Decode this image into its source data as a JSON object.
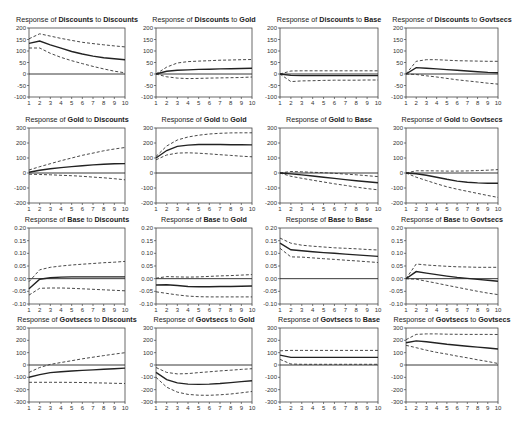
{
  "chart_data": {
    "type": "line",
    "layout": "4x4 grid of impulse response functions",
    "x": [
      1,
      2,
      3,
      4,
      5,
      6,
      7,
      8,
      9,
      10
    ],
    "variables": [
      "Discounts",
      "Gold",
      "Base",
      "Govtsecs"
    ],
    "panels": [
      {
        "row": 0,
        "col": 0,
        "title_prefix": "Response of ",
        "response": "Discounts",
        "title_mid": " to ",
        "shock": "Discounts",
        "ylim": [
          -100,
          200
        ],
        "yticks": [
          200,
          150,
          100,
          50,
          0,
          -50,
          -100
        ],
        "ytick_labels": [
          "200",
          "150",
          "100",
          "50",
          "0",
          "-50",
          "-100"
        ],
        "response_values": [
          133,
          143,
          127,
          112,
          98,
          87,
          78,
          71,
          66,
          62
        ],
        "upper": [
          153,
          175,
          165,
          155,
          146,
          138,
          132,
          127,
          122,
          118
        ],
        "lower": [
          113,
          113,
          90,
          72,
          58,
          45,
          33,
          22,
          12,
          5
        ]
      },
      {
        "row": 0,
        "col": 1,
        "title_prefix": "Response of ",
        "response": "Discounts",
        "title_mid": " to ",
        "shock": "Gold",
        "ylim": [
          -100,
          200
        ],
        "yticks": [
          200,
          150,
          100,
          50,
          0,
          -50,
          -100
        ],
        "ytick_labels": [
          "200",
          "150",
          "100",
          "50",
          "0",
          "-50",
          "-100"
        ],
        "response_values": [
          0,
          12,
          16,
          18,
          20,
          21,
          22,
          23,
          24,
          25
        ],
        "upper": [
          0,
          30,
          48,
          54,
          56,
          58,
          60,
          61,
          62,
          63
        ],
        "lower": [
          0,
          -12,
          -18,
          -20,
          -19,
          -18,
          -17,
          -16,
          -15,
          -13
        ]
      },
      {
        "row": 0,
        "col": 2,
        "title_prefix": "Response of ",
        "response": "Discounts",
        "title_mid": " to ",
        "shock": "Base",
        "ylim": [
          -100,
          200
        ],
        "yticks": [
          200,
          150,
          100,
          50,
          0,
          -50,
          -100
        ],
        "ytick_labels": [
          "200",
          "150",
          "100",
          "50",
          "0",
          "-50",
          "-100"
        ],
        "response_values": [
          0,
          -6,
          -7,
          -7,
          -7,
          -7,
          -7,
          -7,
          -7,
          -7
        ],
        "upper": [
          0,
          13,
          14,
          14,
          14,
          14,
          14,
          14,
          14,
          14
        ],
        "lower": [
          0,
          -33,
          -30,
          -29,
          -28,
          -27,
          -27,
          -27,
          -26,
          -26
        ]
      },
      {
        "row": 0,
        "col": 3,
        "title_prefix": "Response of ",
        "response": "Discounts",
        "title_mid": " to ",
        "shock": "Govtsecs",
        "ylim": [
          -100,
          200
        ],
        "yticks": [
          200,
          150,
          100,
          50,
          0,
          -50,
          -100
        ],
        "ytick_labels": [
          "200",
          "150",
          "100",
          "50",
          "0",
          "-50",
          "-100"
        ],
        "response_values": [
          0,
          28,
          25,
          22,
          19,
          16,
          13,
          10,
          7,
          5
        ],
        "upper": [
          0,
          55,
          62,
          62,
          60,
          58,
          57,
          56,
          55,
          55
        ],
        "lower": [
          0,
          -2,
          -8,
          -13,
          -19,
          -25,
          -30,
          -35,
          -40,
          -44
        ]
      },
      {
        "row": 1,
        "col": 0,
        "title_prefix": "Response of ",
        "response": "Gold",
        "title_mid": " to ",
        "shock": "Discounts",
        "ylim": [
          -200,
          300
        ],
        "yticks": [
          300,
          200,
          100,
          0,
          -100,
          -200
        ],
        "ytick_labels": [
          "300",
          "200",
          "100",
          "0",
          "-100",
          "-200"
        ],
        "response_values": [
          5,
          18,
          28,
          36,
          43,
          49,
          54,
          58,
          61,
          63
        ],
        "upper": [
          20,
          42,
          62,
          82,
          100,
          118,
          133,
          148,
          160,
          170
        ],
        "lower": [
          -8,
          -10,
          -12,
          -15,
          -18,
          -22,
          -27,
          -32,
          -38,
          -45
        ]
      },
      {
        "row": 1,
        "col": 1,
        "title_prefix": "Response of ",
        "response": "Gold",
        "title_mid": " to ",
        "shock": "Gold",
        "ylim": [
          -200,
          300
        ],
        "yticks": [
          300,
          200,
          100,
          0,
          -100,
          -200
        ],
        "ytick_labels": [
          "300",
          "200",
          "100",
          "0",
          "-100",
          "-200"
        ],
        "response_values": [
          100,
          150,
          177,
          186,
          190,
          190,
          190,
          189,
          188,
          187
        ],
        "upper": [
          110,
          180,
          220,
          240,
          252,
          260,
          265,
          267,
          268,
          268
        ],
        "lower": [
          88,
          120,
          133,
          135,
          132,
          127,
          122,
          117,
          112,
          108
        ]
      },
      {
        "row": 1,
        "col": 2,
        "title_prefix": "Response of ",
        "response": "Gold",
        "title_mid": " to ",
        "shock": "Base",
        "ylim": [
          -200,
          300
        ],
        "yticks": [
          300,
          200,
          100,
          0,
          -100,
          -200
        ],
        "ytick_labels": [
          "300",
          "200",
          "100",
          "0",
          "-100",
          "-200"
        ],
        "response_values": [
          0,
          -6,
          -13,
          -20,
          -28,
          -36,
          -44,
          -52,
          -59,
          -65
        ],
        "upper": [
          0,
          10,
          8,
          5,
          2,
          -2,
          -7,
          -12,
          -18,
          -24
        ],
        "lower": [
          0,
          -22,
          -35,
          -48,
          -60,
          -72,
          -83,
          -94,
          -104,
          -112
        ]
      },
      {
        "row": 1,
        "col": 3,
        "title_prefix": "Response of ",
        "response": "Gold",
        "title_mid": " to ",
        "shock": "Govtsecs",
        "ylim": [
          -200,
          300
        ],
        "yticks": [
          300,
          200,
          100,
          0,
          -100,
          -200
        ],
        "ytick_labels": [
          "300",
          "200",
          "100",
          "0",
          "-100",
          "-200"
        ],
        "response_values": [
          0,
          -5,
          -15,
          -28,
          -42,
          -54,
          -62,
          -66,
          -68,
          -69
        ],
        "upper": [
          0,
          15,
          15,
          14,
          13,
          13,
          14,
          16,
          19,
          23
        ],
        "lower": [
          0,
          -28,
          -50,
          -72,
          -92,
          -108,
          -122,
          -136,
          -150,
          -163
        ]
      },
      {
        "row": 2,
        "col": 0,
        "title_prefix": "Response of ",
        "response": "Base",
        "title_mid": " to ",
        "shock": "Discounts",
        "ylim": [
          -0.1,
          0.2
        ],
        "yticks": [
          0.2,
          0.15,
          0.1,
          0.05,
          0.0,
          -0.05,
          -0.1
        ],
        "ytick_labels": [
          "0.20",
          "0.15",
          "0.10",
          "0.05",
          "0.00",
          "-0.05",
          "-0.10"
        ],
        "response_values": [
          -0.04,
          -0.002,
          0.004,
          0.006,
          0.007,
          0.007,
          0.007,
          0.007,
          0.007,
          0.007
        ],
        "upper": [
          -0.012,
          0.035,
          0.045,
          0.05,
          0.054,
          0.057,
          0.06,
          0.063,
          0.065,
          0.068
        ],
        "lower": [
          -0.065,
          -0.038,
          -0.037,
          -0.037,
          -0.038,
          -0.04,
          -0.042,
          -0.044,
          -0.046,
          -0.048
        ]
      },
      {
        "row": 2,
        "col": 1,
        "title_prefix": "Response of ",
        "response": "Base",
        "title_mid": " to ",
        "shock": "Gold",
        "ylim": [
          -0.1,
          0.2
        ],
        "yticks": [
          0.2,
          0.15,
          0.1,
          0.05,
          0.0,
          -0.05,
          -0.1
        ],
        "ytick_labels": [
          "0.20",
          "0.15",
          "0.10",
          "0.05",
          "0.00",
          "-0.05",
          "-0.10"
        ],
        "response_values": [
          -0.025,
          -0.024,
          -0.027,
          -0.031,
          -0.032,
          -0.032,
          -0.031,
          -0.031,
          -0.03,
          -0.029
        ],
        "upper": [
          0.002,
          0.008,
          0.007,
          0.006,
          0.007,
          0.009,
          0.011,
          0.012,
          0.014,
          0.016
        ],
        "lower": [
          -0.052,
          -0.058,
          -0.064,
          -0.069,
          -0.071,
          -0.072,
          -0.072,
          -0.072,
          -0.072,
          -0.072
        ]
      },
      {
        "row": 2,
        "col": 2,
        "title_prefix": "Response of ",
        "response": "Base",
        "title_mid": " to ",
        "shock": "Base",
        "ylim": [
          -0.1,
          0.2
        ],
        "yticks": [
          0.2,
          0.15,
          0.1,
          0.05,
          0.0,
          -0.05,
          -0.1
        ],
        "ytick_labels": [
          "0.20",
          "0.15",
          "0.10",
          "0.05",
          "0.00",
          "-0.05",
          "-0.10"
        ],
        "response_values": [
          0.14,
          0.114,
          0.11,
          0.106,
          0.103,
          0.1,
          0.097,
          0.094,
          0.091,
          0.088
        ],
        "upper": [
          0.16,
          0.14,
          0.132,
          0.128,
          0.125,
          0.122,
          0.12,
          0.118,
          0.115,
          0.113
        ],
        "lower": [
          0.12,
          0.086,
          0.085,
          0.082,
          0.079,
          0.076,
          0.073,
          0.07,
          0.067,
          0.064
        ]
      },
      {
        "row": 2,
        "col": 3,
        "title_prefix": "Response of ",
        "response": "Base",
        "title_mid": " to ",
        "shock": "Govtsecs",
        "ylim": [
          -0.1,
          0.2
        ],
        "yticks": [
          0.2,
          0.15,
          0.1,
          0.05,
          0.0,
          -0.05,
          -0.1
        ],
        "ytick_labels": [
          "0.20",
          "0.15",
          "0.10",
          "0.05",
          "0.00",
          "-0.05",
          "-0.10"
        ],
        "response_values": [
          0.0,
          0.028,
          0.022,
          0.016,
          0.01,
          0.005,
          0.001,
          -0.003,
          -0.006,
          -0.01
        ],
        "upper": [
          0.0,
          0.058,
          0.054,
          0.051,
          0.049,
          0.047,
          0.046,
          0.045,
          0.045,
          0.045
        ],
        "lower": [
          0.0,
          -0.002,
          -0.01,
          -0.018,
          -0.026,
          -0.034,
          -0.042,
          -0.05,
          -0.057,
          -0.063
        ]
      },
      {
        "row": 3,
        "col": 0,
        "title_prefix": "Response of ",
        "response": "Govtsecs",
        "title_mid": " to ",
        "shock": "Discounts",
        "ylim": [
          -300,
          300
        ],
        "yticks": [
          300,
          200,
          100,
          0,
          -100,
          -200,
          -300
        ],
        "ytick_labels": [
          "300",
          "200",
          "100",
          "0",
          "-100",
          "-200",
          "-300"
        ],
        "response_values": [
          -100,
          -78,
          -62,
          -54,
          -49,
          -44,
          -40,
          -35,
          -30,
          -25
        ],
        "upper": [
          -60,
          -20,
          5,
          20,
          35,
          50,
          63,
          76,
          88,
          100
        ],
        "lower": [
          -140,
          -140,
          -140,
          -140,
          -141,
          -142,
          -144,
          -146,
          -148,
          -150
        ]
      },
      {
        "row": 3,
        "col": 1,
        "title_prefix": "Response of ",
        "response": "Govtsecs",
        "title_mid": " to ",
        "shock": "Gold",
        "ylim": [
          -300,
          300
        ],
        "yticks": [
          300,
          200,
          100,
          0,
          -100,
          -200,
          -300
        ],
        "ytick_labels": [
          "300",
          "200",
          "100",
          "0",
          "-100",
          "-200",
          "-300"
        ],
        "response_values": [
          -60,
          -118,
          -145,
          -155,
          -157,
          -155,
          -150,
          -143,
          -135,
          -127
        ],
        "upper": [
          -20,
          -60,
          -72,
          -70,
          -62,
          -55,
          -48,
          -42,
          -36,
          -30
        ],
        "lower": [
          -100,
          -180,
          -220,
          -238,
          -245,
          -246,
          -242,
          -235,
          -225,
          -215
        ]
      },
      {
        "row": 3,
        "col": 2,
        "title_prefix": "Response of ",
        "response": "Govtsecs",
        "title_mid": " to ",
        "shock": "Base",
        "ylim": [
          -300,
          300
        ],
        "yticks": [
          300,
          200,
          100,
          0,
          -100,
          -200,
          -300
        ],
        "ytick_labels": [
          "300",
          "200",
          "100",
          "0",
          "-100",
          "-200",
          "-300"
        ],
        "response_values": [
          80,
          62,
          62,
          62,
          62,
          62,
          62,
          62,
          62,
          62
        ],
        "upper": [
          115,
          118,
          118,
          118,
          118,
          118,
          118,
          118,
          118,
          118
        ],
        "lower": [
          45,
          8,
          6,
          6,
          6,
          6,
          6,
          6,
          6,
          6
        ]
      },
      {
        "row": 3,
        "col": 3,
        "title_prefix": "Response of ",
        "response": "Govtsecs",
        "title_mid": " to ",
        "shock": "Govtsecs",
        "ylim": [
          -300,
          300
        ],
        "yticks": [
          300,
          200,
          100,
          0,
          -100,
          -200,
          -300
        ],
        "ytick_labels": [
          "300",
          "200",
          "100",
          "0",
          "-100",
          "-200",
          "-300"
        ],
        "response_values": [
          180,
          195,
          188,
          178,
          168,
          160,
          152,
          145,
          138,
          130
        ],
        "upper": [
          205,
          248,
          252,
          252,
          250,
          249,
          248,
          248,
          248,
          247
        ],
        "lower": [
          160,
          140,
          120,
          102,
          88,
          72,
          58,
          42,
          28,
          12
        ]
      }
    ],
    "xlabel": "",
    "ylabel": "",
    "grid": false,
    "legend": null,
    "line_styles": {
      "response": "solid",
      "bands": "dashed"
    }
  }
}
